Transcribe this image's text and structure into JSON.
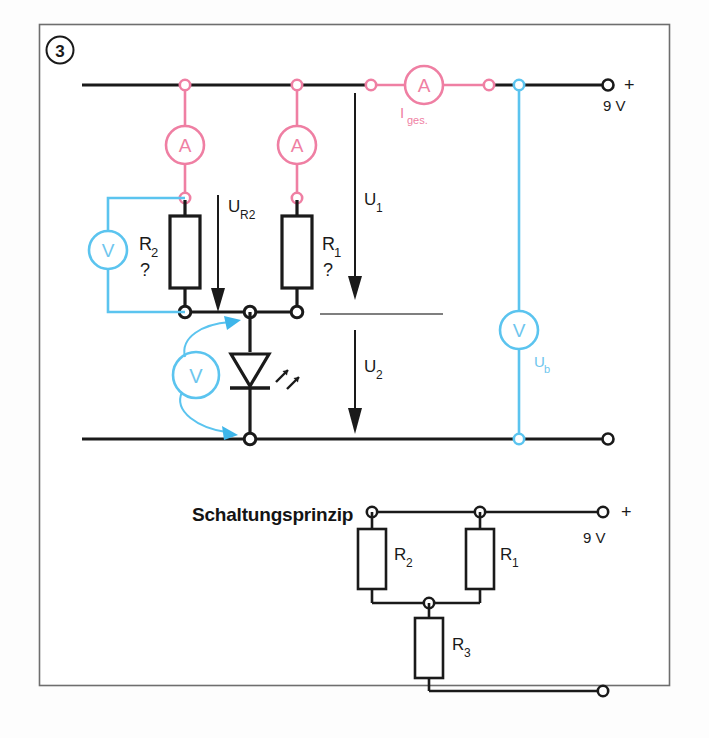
{
  "figure": {
    "number_badge": "3",
    "caption_principle": "Schaltungsprinzip"
  },
  "colors": {
    "wire_black": "#1a1a1a",
    "ammeter_pink": "#ef7fa3",
    "voltmeter_blue": "#5bc4ef",
    "frame": "#6e6e6e",
    "background": "#fdfdfd"
  },
  "main_circuit": {
    "supply": {
      "polarity": "+",
      "voltage": "9 V"
    },
    "meters": [
      {
        "id": "meter-a-r2",
        "symbol": "A",
        "type": "ammeter",
        "label": ""
      },
      {
        "id": "meter-a-r1",
        "symbol": "A",
        "type": "ammeter",
        "label": ""
      },
      {
        "id": "meter-a-total",
        "symbol": "A",
        "type": "ammeter",
        "label": "I",
        "label_sub": "ges."
      },
      {
        "id": "meter-v-r2",
        "symbol": "V",
        "type": "voltmeter",
        "label": ""
      },
      {
        "id": "meter-v-led",
        "symbol": "V",
        "type": "voltmeter",
        "label": ""
      },
      {
        "id": "meter-v-supply",
        "symbol": "V",
        "type": "voltmeter",
        "label": "U",
        "label_sub": "b"
      }
    ],
    "resistors": [
      {
        "id": "resistor-r2",
        "label": "R",
        "label_sub": "2",
        "value": "?"
      },
      {
        "id": "resistor-r1",
        "label": "R",
        "label_sub": "1",
        "value": "?"
      }
    ],
    "led": {
      "id": "led",
      "name": "light-emitting-diode"
    },
    "voltage_arrows": [
      {
        "id": "arrow-ur2",
        "label": "U",
        "label_sub": "R2"
      },
      {
        "id": "arrow-u1",
        "label": "U",
        "label_sub": "1"
      },
      {
        "id": "arrow-u2",
        "label": "U",
        "label_sub": "2"
      }
    ]
  },
  "principle_circuit": {
    "supply": {
      "polarity": "+",
      "voltage": "9 V"
    },
    "resistors": [
      {
        "id": "p-resistor-r2",
        "label": "R",
        "label_sub": "2"
      },
      {
        "id": "p-resistor-r1",
        "label": "R",
        "label_sub": "1"
      },
      {
        "id": "p-resistor-r3",
        "label": "R",
        "label_sub": "3"
      }
    ]
  }
}
